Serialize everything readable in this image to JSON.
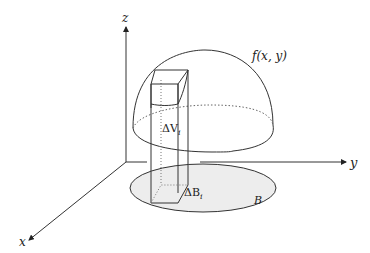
{
  "diagram": {
    "axes": {
      "x_label": "x",
      "y_label": "y",
      "z_label": "z"
    },
    "surface_label": "f(x, y)",
    "region_label": "B",
    "column_volume_label": "ΔV",
    "column_volume_subscript": "i",
    "base_area_label": "ΔB",
    "base_area_subscript": "i",
    "colors": {
      "stroke": "#333333",
      "region_fill": "#ededed",
      "dotted": "#666666"
    }
  }
}
